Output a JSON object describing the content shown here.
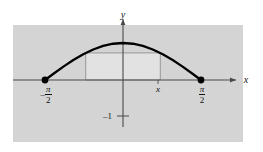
{
  "figure": {
    "title": "",
    "background_color": "#d4d4d4",
    "page_color": "#ffffff",
    "curve_color": "#000000",
    "axis_color": "#555555",
    "rect_fill_color": "#e2e2e2",
    "rect_stroke_color": "#888888",
    "labels": {
      "y_axis": "y",
      "x_axis": "x",
      "x_point": "x",
      "minus_one": "–1",
      "left_endpoint_sign": "–",
      "left_endpoint_numerator": "π",
      "left_endpoint_denominator": "2",
      "right_endpoint_numerator": "π",
      "right_endpoint_denominator": "2"
    }
  },
  "chart_data": {
    "type": "line",
    "title": "",
    "xlabel": "x",
    "ylabel": "y",
    "function": "y = cos(x)",
    "xlim": [
      -2.2,
      2.4
    ],
    "ylim": [
      -1.45,
      1.45
    ],
    "xticks": [
      -1.5707963,
      1.5707963
    ],
    "xticklabels": [
      "-π/2",
      "π/2"
    ],
    "yticks": [
      -1
    ],
    "yticklabels": [
      "-1"
    ],
    "grid": false,
    "legend": null,
    "series": [
      {
        "name": "cos(x)",
        "x": [
          -1.5707963,
          -1.4,
          -1.2,
          -1.0,
          -0.8,
          -0.6,
          -0.4,
          -0.2,
          0.0,
          0.2,
          0.4,
          0.6,
          0.8,
          1.0,
          1.2,
          1.4,
          1.5707963
        ],
        "y": [
          0.0,
          0.17,
          0.3624,
          0.5403,
          0.6967,
          0.8253,
          0.9211,
          0.9801,
          1.0,
          0.9801,
          0.9211,
          0.8253,
          0.6967,
          0.5403,
          0.3624,
          0.17,
          0.0
        ]
      }
    ],
    "markers": [
      {
        "name": "left-endpoint",
        "x": -1.5707963,
        "y": 0,
        "label": "-π/2"
      },
      {
        "name": "right-endpoint",
        "x": 1.5707963,
        "y": 0,
        "label": "π/2"
      }
    ],
    "shaded_rectangle": {
      "x_left": -0.75,
      "x_right": 0.75,
      "y_bottom": 0.0,
      "y_top": 0.7317,
      "label": "x",
      "description": "inscribed rectangle with corners on the cosine curve"
    },
    "annotations": [
      {
        "text": "y",
        "x": 0,
        "y": 1.42,
        "role": "axis-name"
      },
      {
        "text": "x",
        "x": 2.32,
        "y": -0.06,
        "role": "axis-name"
      },
      {
        "text": "x",
        "x": 0.75,
        "y": -0.16,
        "role": "point-label"
      },
      {
        "text": "-1",
        "x": -0.16,
        "y": -1.0,
        "role": "tick-label"
      }
    ]
  }
}
